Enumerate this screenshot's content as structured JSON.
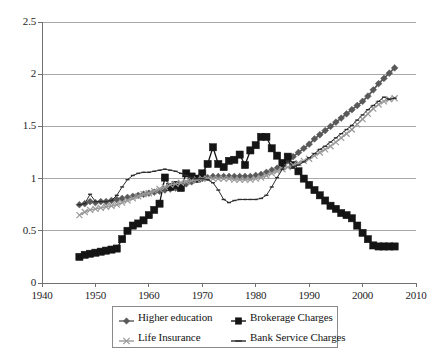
{
  "chart_data": {
    "type": "line",
    "title": "",
    "subtitle": "",
    "xlabel": "",
    "ylabel": "",
    "xlim": [
      1940,
      2010
    ],
    "ylim": [
      0,
      2.5
    ],
    "grid": true,
    "grid_axis": "y",
    "legend_position": "bottom",
    "legend_columns": 2,
    "x_ticks": [
      1940,
      1950,
      1960,
      1970,
      1980,
      1990,
      2000,
      2010
    ],
    "x_tick_labels": [
      "1940",
      "1950",
      "1960",
      "1970",
      "1980",
      "1990",
      "2000",
      "2010"
    ],
    "y_ticks": [
      0,
      0.5,
      1,
      1.5,
      2,
      2.5
    ],
    "y_tick_labels": [
      "0",
      "0.5",
      "1",
      "1.5",
      "2",
      "2.5"
    ],
    "x": [
      1947,
      1948,
      1949,
      1950,
      1951,
      1952,
      1953,
      1954,
      1955,
      1956,
      1957,
      1958,
      1959,
      1960,
      1961,
      1962,
      1963,
      1964,
      1965,
      1966,
      1967,
      1968,
      1969,
      1970,
      1971,
      1972,
      1973,
      1974,
      1975,
      1976,
      1977,
      1978,
      1979,
      1980,
      1981,
      1982,
      1983,
      1984,
      1985,
      1986,
      1987,
      1988,
      1989,
      1990,
      1991,
      1992,
      1993,
      1994,
      1995,
      1996,
      1997,
      1998,
      1999,
      2000,
      2001,
      2002,
      2003,
      2004,
      2005,
      2006
    ],
    "series": [
      {
        "name": "Higher education",
        "color": "#595959",
        "marker": "diamond",
        "marker_size": 3.4,
        "line_width": 1.7,
        "values": [
          0.75,
          0.76,
          0.78,
          0.77,
          0.78,
          0.78,
          0.79,
          0.8,
          0.81,
          0.82,
          0.83,
          0.84,
          0.85,
          0.86,
          0.87,
          0.88,
          0.89,
          0.9,
          0.91,
          0.93,
          0.95,
          0.97,
          0.99,
          1.0,
          1.01,
          1.02,
          1.02,
          1.02,
          1.02,
          1.02,
          1.02,
          1.02,
          1.02,
          1.03,
          1.04,
          1.06,
          1.08,
          1.1,
          1.13,
          1.17,
          1.21,
          1.25,
          1.29,
          1.33,
          1.38,
          1.42,
          1.46,
          1.5,
          1.54,
          1.58,
          1.62,
          1.66,
          1.7,
          1.74,
          1.79,
          1.85,
          1.91,
          1.96,
          2.01,
          2.06
        ]
      },
      {
        "name": "Brokerage Charges",
        "color": "#151515",
        "marker": "square",
        "marker_size": 3.6,
        "line_width": 1.3,
        "values": [
          0.25,
          0.27,
          0.28,
          0.29,
          0.3,
          0.31,
          0.32,
          0.33,
          0.42,
          0.5,
          0.55,
          0.57,
          0.6,
          0.65,
          0.7,
          0.76,
          1.01,
          0.92,
          0.94,
          0.91,
          1.05,
          1.02,
          1.0,
          1.05,
          1.14,
          1.3,
          1.14,
          1.11,
          1.17,
          1.18,
          1.23,
          1.13,
          1.27,
          1.32,
          1.4,
          1.4,
          1.29,
          1.22,
          1.15,
          1.21,
          1.13,
          1.07,
          1.0,
          0.94,
          0.89,
          0.84,
          0.79,
          0.74,
          0.71,
          0.67,
          0.65,
          0.62,
          0.55,
          0.48,
          0.42,
          0.36,
          0.35,
          0.35,
          0.35,
          0.35
        ]
      },
      {
        "name": "Life Insurance",
        "color": "#9a9a9a",
        "marker": "x",
        "marker_size": 3.0,
        "line_width": 1.5,
        "values": [
          0.65,
          0.68,
          0.7,
          0.71,
          0.72,
          0.73,
          0.74,
          0.75,
          0.77,
          0.79,
          0.81,
          0.83,
          0.85,
          0.86,
          0.88,
          0.9,
          0.92,
          0.94,
          0.95,
          0.96,
          0.97,
          0.98,
          0.99,
          1.0,
          1.0,
          1.0,
          1.0,
          1.0,
          1.0,
          0.99,
          0.99,
          0.99,
          0.99,
          1.0,
          1.01,
          1.03,
          1.05,
          1.07,
          1.09,
          1.11,
          1.13,
          1.15,
          1.17,
          1.19,
          1.22,
          1.25,
          1.28,
          1.31,
          1.35,
          1.39,
          1.43,
          1.47,
          1.52,
          1.57,
          1.62,
          1.67,
          1.71,
          1.74,
          1.76,
          1.77
        ]
      },
      {
        "name": "Bank Service Charges",
        "color": "#2d2d2d",
        "marker": "dash",
        "marker_size": 2.0,
        "line_width": 1.0,
        "values": [
          0.75,
          0.76,
          0.85,
          0.78,
          0.78,
          0.78,
          0.79,
          0.84,
          0.92,
          0.99,
          1.03,
          1.05,
          1.06,
          1.06,
          1.07,
          1.08,
          1.09,
          1.08,
          1.07,
          1.05,
          1.03,
          1.01,
          1.0,
          1.0,
          0.99,
          0.96,
          0.89,
          0.8,
          0.77,
          0.79,
          0.8,
          0.8,
          0.8,
          0.8,
          0.81,
          0.84,
          0.92,
          1.01,
          1.09,
          1.17,
          1.11,
          1.13,
          1.16,
          1.2,
          1.24,
          1.28,
          1.31,
          1.35,
          1.39,
          1.43,
          1.47,
          1.51,
          1.56,
          1.61,
          1.66,
          1.7,
          1.74,
          1.78,
          1.76,
          1.77
        ]
      }
    ]
  },
  "axes": {
    "y_labels": [
      "2.5",
      "2",
      "1.5",
      "1",
      "0.5",
      "0"
    ],
    "x_labels": [
      "1940",
      "1950",
      "1960",
      "1970",
      "1980",
      "1990",
      "2000",
      "2010"
    ]
  },
  "legend": {
    "entries": [
      {
        "label": "Higher education",
        "marker": "diamond",
        "color": "#595959"
      },
      {
        "label": "Brokerage Charges",
        "marker": "square",
        "color": "#151515"
      },
      {
        "label": "Life Insurance",
        "marker": "x",
        "color": "#9a9a9a"
      },
      {
        "label": "Bank Service Charges",
        "marker": "dash",
        "color": "#2d2d2d"
      }
    ]
  },
  "colors": {
    "axis": "#8a8a8a",
    "grid": "#a8a8a8",
    "text": "#1a1a1a",
    "background": "#ffffff"
  }
}
